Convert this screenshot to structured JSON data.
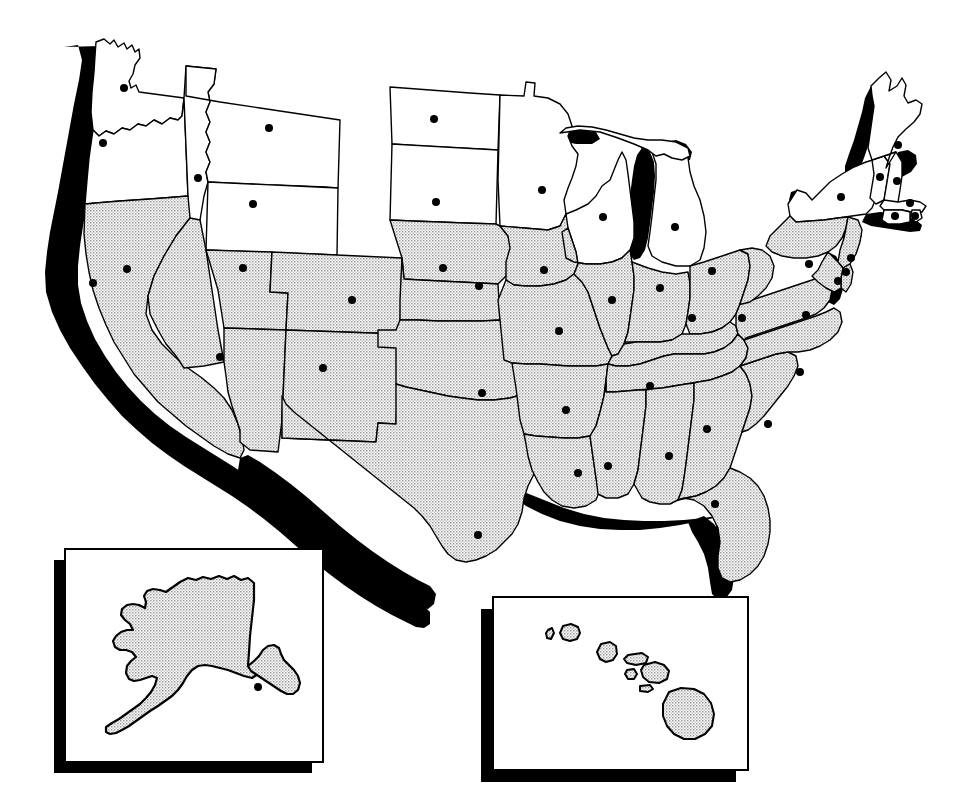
{
  "figure": {
    "kind": "map",
    "projection_note": "Conterminous United States with Alaska and Hawaii insets",
    "background_color": "#ffffff",
    "outline_color": "#000000",
    "shadow_color": "#000000",
    "fill_shaded": "#d9d9d9",
    "fill_plain": "#ffffff",
    "capital_dot_color": "#000000",
    "capital_dot_radius_px": 4
  },
  "legend_note": "No printed legend, labels or text appear in the image",
  "insets": [
    {
      "id": "alaska",
      "name": "Alaska inset",
      "frame": {
        "x": 65,
        "y": 549,
        "width": 258,
        "height": 213
      },
      "shadow_offset": {
        "dx": -11,
        "dy": 11
      },
      "frame_fill": "#ffffff",
      "frame_stroke": "#000000",
      "has_capital_dot": true
    },
    {
      "id": "hawaii",
      "name": "Hawaii inset",
      "frame": {
        "x": 493,
        "y": 597,
        "width": 255,
        "height": 173
      },
      "shadow_offset": {
        "dx": -12,
        "dy": 12
      },
      "frame_fill": "#ffffff",
      "frame_stroke": "#000000",
      "has_capital_dot": false,
      "island_count": 8
    }
  ],
  "shading_groups": {
    "plain_white_states": [
      "Washington",
      "Oregon",
      "Idaho",
      "Montana",
      "Wyoming",
      "North Dakota",
      "South Dakota",
      "Minnesota",
      "Wisconsin",
      "Michigan",
      "New York",
      "Vermont",
      "New Hampshire",
      "Maine",
      "Massachusetts",
      "Rhode Island",
      "Connecticut"
    ],
    "stippled_gray_states": [
      "California",
      "Nevada",
      "Utah",
      "Arizona",
      "Colorado",
      "New Mexico",
      "Nebraska",
      "Kansas",
      "Oklahoma",
      "Texas",
      "Iowa",
      "Missouri",
      "Arkansas",
      "Louisiana",
      "Illinois",
      "Indiana",
      "Ohio",
      "Kentucky",
      "Tennessee",
      "Mississippi",
      "Alabama",
      "Georgia",
      "Florida",
      "South Carolina",
      "North Carolina",
      "Virginia",
      "West Virginia",
      "Pennsylvania",
      "Maryland",
      "Delaware",
      "New Jersey",
      "Alaska",
      "Hawaii"
    ]
  },
  "capitals": [
    {
      "state": "Washington",
      "x": 124,
      "y": 88
    },
    {
      "state": "Oregon",
      "x": 103,
      "y": 143
    },
    {
      "state": "Idaho",
      "x": 198,
      "y": 178
    },
    {
      "state": "Montana",
      "x": 269,
      "y": 128
    },
    {
      "state": "Wyoming",
      "x": 253,
      "y": 204
    },
    {
      "state": "North Dakota",
      "x": 434,
      "y": 119
    },
    {
      "state": "South Dakota",
      "x": 436,
      "y": 202
    },
    {
      "state": "Nebraska",
      "x": 443,
      "y": 268
    },
    {
      "state": "California",
      "x": 93,
      "y": 283
    },
    {
      "state": "Nevada",
      "x": 127,
      "y": 269
    },
    {
      "state": "Utah",
      "x": 243,
      "y": 268
    },
    {
      "state": "Colorado",
      "x": 352,
      "y": 300
    },
    {
      "state": "Arizona",
      "x": 220,
      "y": 357
    },
    {
      "state": "New Mexico",
      "x": 323,
      "y": 368
    },
    {
      "state": "Kansas",
      "x": 479,
      "y": 286
    },
    {
      "state": "Oklahoma",
      "x": 482,
      "y": 393
    },
    {
      "state": "Texas",
      "x": 478,
      "y": 535
    },
    {
      "state": "Minnesota",
      "x": 542,
      "y": 190
    },
    {
      "state": "Iowa",
      "x": 544,
      "y": 270
    },
    {
      "state": "Missouri",
      "x": 559,
      "y": 331
    },
    {
      "state": "Arkansas",
      "x": 566,
      "y": 410
    },
    {
      "state": "Louisiana",
      "x": 578,
      "y": 473
    },
    {
      "state": "Wisconsin",
      "x": 603,
      "y": 217
    },
    {
      "state": "Illinois",
      "x": 612,
      "y": 300
    },
    {
      "state": "Michigan",
      "x": 675,
      "y": 227
    },
    {
      "state": "Indiana",
      "x": 660,
      "y": 288
    },
    {
      "state": "Kentucky",
      "x": 692,
      "y": 318
    },
    {
      "state": "Tennessee",
      "x": 650,
      "y": 386
    },
    {
      "state": "Mississippi",
      "x": 608,
      "y": 466
    },
    {
      "state": "Alabama",
      "x": 669,
      "y": 456
    },
    {
      "state": "Georgia",
      "x": 707,
      "y": 429
    },
    {
      "state": "Florida",
      "x": 715,
      "y": 504
    },
    {
      "state": "Ohio",
      "x": 712,
      "y": 271
    },
    {
      "state": "West Virginia",
      "x": 742,
      "y": 318
    },
    {
      "state": "Virginia",
      "x": 806,
      "y": 315
    },
    {
      "state": "North Carolina",
      "x": 800,
      "y": 372
    },
    {
      "state": "South Carolina",
      "x": 768,
      "y": 424
    },
    {
      "state": "Pennsylvania",
      "x": 809,
      "y": 264
    },
    {
      "state": "New York",
      "x": 841,
      "y": 197
    },
    {
      "state": "Vermont",
      "x": 880,
      "y": 177
    },
    {
      "state": "New Hampshire",
      "x": 897,
      "y": 181
    },
    {
      "state": "Maine",
      "x": 898,
      "y": 145
    },
    {
      "state": "Massachusetts",
      "x": 910,
      "y": 203
    },
    {
      "state": "Connecticut",
      "x": 895,
      "y": 216
    },
    {
      "state": "Rhode Island",
      "x": 915,
      "y": 216
    },
    {
      "state": "New Jersey",
      "x": 851,
      "y": 258
    },
    {
      "state": "Delaware",
      "x": 846,
      "y": 272
    },
    {
      "state": "Maryland",
      "x": 838,
      "y": 281
    },
    {
      "state": "Alaska",
      "x": 258,
      "y": 687
    }
  ]
}
